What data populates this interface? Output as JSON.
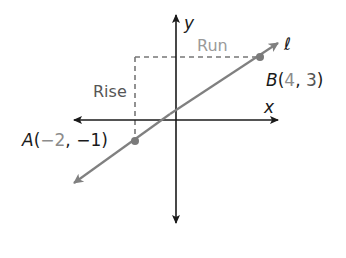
{
  "diagram": {
    "axes": {
      "x_label": "x",
      "y_label": "y"
    },
    "line": {
      "name": "ℓ",
      "color": "#808080"
    },
    "points": [
      {
        "name": "A",
        "x": "−2",
        "y": "−1",
        "open": "(",
        "sep": ", ",
        "close": ")"
      },
      {
        "name": "B",
        "x": "4",
        "y": "3",
        "open": "(",
        "sep": ", ",
        "close": ")"
      }
    ],
    "annotations": {
      "rise": "Rise",
      "run": "Run"
    },
    "colors": {
      "axis": "#1a1a1a",
      "line": "#808080",
      "dashed": "#777777",
      "point": "#7a7a7a",
      "label_dark": "#1a1a1a",
      "label_gray": "#8c8c8c",
      "rise_text": "#555555",
      "run_text": "#9a9a9a"
    }
  }
}
